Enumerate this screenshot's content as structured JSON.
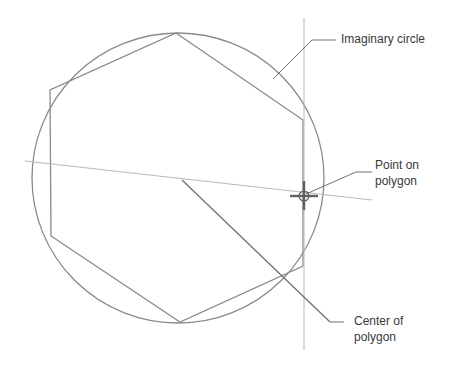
{
  "diagram": {
    "labels": {
      "imaginary_circle": "Imaginary circle",
      "point_on_polygon_line1": "Point on",
      "point_on_polygon_line2": "polygon",
      "center_line1": "Center of",
      "center_line2": "polygon"
    },
    "colors": {
      "stroke": "#8a8a8a",
      "guide": "#b8b8b8",
      "text": "#3a3a3a"
    }
  }
}
